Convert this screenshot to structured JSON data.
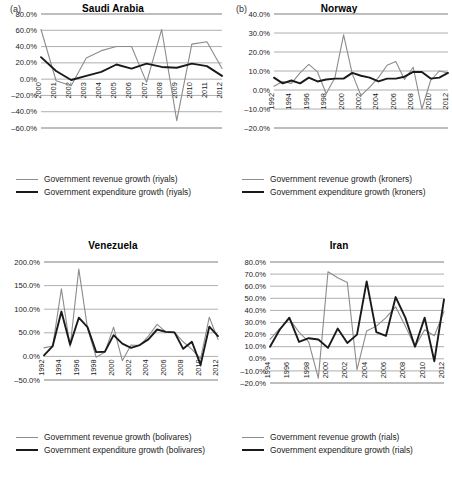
{
  "figure": {
    "panels": [
      {
        "tag": "(a)",
        "title": "Saudi Arabia",
        "legend": [
          {
            "label": "Government revenue growth (riyals)",
            "style": "rev"
          },
          {
            "label": "Government expenditure growth (riyals)",
            "style": "exp"
          }
        ],
        "chart_data": {
          "type": "line",
          "title": "Saudi Arabia",
          "xlabel": "",
          "ylabel": "",
          "grid": true,
          "legend_position": "bottom",
          "ylim": [
            -60,
            80
          ],
          "yticks": [
            -60,
            -40,
            -20,
            0,
            20,
            40,
            60,
            80
          ],
          "ytick_labels": [
            "–60.0%",
            "–40.0%",
            "–20.0%",
            "0.0%",
            "20.0%",
            "40.0%",
            "60.0%",
            "80.0%"
          ],
          "x": [
            2000,
            2001,
            2002,
            2003,
            2004,
            2005,
            2006,
            2007,
            2008,
            2009,
            2010,
            2011,
            2012
          ],
          "xtick_labels": [
            "2000",
            "2001",
            "2002",
            "2003",
            "2004",
            "2005",
            "2006",
            "2007",
            "2008",
            "2009",
            "2010",
            "2011",
            "2012"
          ],
          "series": [
            {
              "name": "Government revenue growth (riyals)",
              "color": "#8c8c8c",
              "values": [
                61.0,
                -2.0,
                -8.0,
                26.0,
                35.0,
                40.0,
                40.0,
                -4.0,
                61.0,
                -51.0,
                43.0,
                46.0,
                13.0
              ]
            },
            {
              "name": "Government expenditure growth (riyals)",
              "color": "#1a1a1a",
              "values": [
                27.0,
                10.0,
                -1.0,
                4.0,
                9.0,
                18.0,
                13.0,
                19.0,
                15.0,
                14.0,
                19.0,
                16.0,
                4.0
              ]
            }
          ]
        }
      },
      {
        "tag": "(b)",
        "title": "Norway",
        "legend": [
          {
            "label": "Government revenue growth (kroners)",
            "style": "rev"
          },
          {
            "label": "Government expenditure growth (kroners)",
            "style": "exp"
          }
        ],
        "chart_data": {
          "type": "line",
          "title": "Norway",
          "xlabel": "",
          "ylabel": "",
          "grid": true,
          "legend_position": "bottom",
          "ylim": [
            -20,
            40
          ],
          "yticks": [
            -20,
            -10,
            0,
            10,
            20,
            30,
            40
          ],
          "ytick_labels": [
            "–20.0%",
            "–10.0%",
            "0.0%",
            "10.0%",
            "20.0%",
            "30.0%",
            "40.0%"
          ],
          "x": [
            1992,
            1993,
            1994,
            1995,
            1996,
            1997,
            1998,
            1999,
            2000,
            2001,
            2002,
            2003,
            2004,
            2005,
            2006,
            2007,
            2008,
            2009,
            2010,
            2011,
            2012
          ],
          "xtick_labels": [
            "1992",
            "1994",
            "1996",
            "1998",
            "2000",
            "2002",
            "2004",
            "2006",
            "2008",
            "2010",
            "2012"
          ],
          "series": [
            {
              "name": "Government revenue growth (kroners)",
              "color": "#8c8c8c",
              "values": [
                2.0,
                4.5,
                3.5,
                9.0,
                13.5,
                9.5,
                -2.0,
                6.5,
                29.0,
                8.5,
                -3.0,
                1.5,
                6.5,
                13.0,
                15.0,
                5.5,
                12.0,
                -10.0,
                5.0,
                10.0,
                9.0
              ]
            },
            {
              "name": "Government expenditure growth (kroners)",
              "color": "#1a1a1a",
              "values": [
                6.5,
                3.5,
                5.0,
                3.5,
                6.5,
                4.5,
                5.5,
                6.0,
                6.0,
                9.0,
                7.5,
                6.5,
                4.5,
                6.0,
                6.0,
                7.0,
                9.5,
                9.5,
                6.0,
                6.5,
                9.0
              ]
            }
          ]
        }
      },
      {
        "tag": "",
        "title": "Venezuela",
        "legend": [
          {
            "label": "Government revenue growth (bolivares)",
            "style": "rev"
          },
          {
            "label": "Government expenditure growth (bolivares)",
            "style": "exp"
          }
        ],
        "chart_data": {
          "type": "line",
          "title": "Venezuela",
          "xlabel": "",
          "ylabel": "",
          "grid": true,
          "legend_position": "bottom",
          "ylim": [
            -50,
            200
          ],
          "yticks": [
            -50,
            0,
            50,
            100,
            150,
            200
          ],
          "ytick_labels": [
            "–50.0%",
            "0.0%",
            "50.0%",
            "100.0%",
            "150.0%",
            "200.0%"
          ],
          "x": [
            1992,
            1993,
            1994,
            1995,
            1996,
            1997,
            1998,
            1999,
            2000,
            2001,
            2002,
            2003,
            2004,
            2005,
            2006,
            2007,
            2008,
            2009,
            2010,
            2011,
            2012
          ],
          "xtick_labels": [
            "1992",
            "1994",
            "1996",
            "1998",
            "2000",
            "2002",
            "2004",
            "2006",
            "2008",
            "2010",
            "2012"
          ],
          "series": [
            {
              "name": "Government revenue growth (bolivares)",
              "color": "#8c8c8c",
              "values": [
                18.0,
                22.0,
                143.0,
                20.0,
                185.0,
                60.0,
                -2.0,
                9.0,
                62.0,
                -9.0,
                24.0,
                23.0,
                43.0,
                68.0,
                52.0,
                51.0,
                31.0,
                15.0,
                -5.0,
                83.0,
                36.0
              ]
            },
            {
              "name": "Government expenditure growth (bolivares)",
              "color": "#1a1a1a",
              "values": [
                2.0,
                22.0,
                95.0,
                25.0,
                82.0,
                62.0,
                9.0,
                10.0,
                45.0,
                27.0,
                18.0,
                24.0,
                36.0,
                57.0,
                52.0,
                51.0,
                16.0,
                31.0,
                -18.0,
                63.0,
                43.0
              ]
            }
          ]
        }
      },
      {
        "tag": "",
        "title": "Iran",
        "legend": [
          {
            "label": "Government revenue growth (rials)",
            "style": "rev"
          },
          {
            "label": "Government expenditure growth (rials)",
            "style": "exp"
          }
        ],
        "chart_data": {
          "type": "line",
          "title": "Iran",
          "xlabel": "",
          "ylabel": "",
          "grid": true,
          "legend_position": "bottom",
          "ylim": [
            -20,
            80
          ],
          "yticks": [
            -20,
            -10,
            0,
            10,
            20,
            30,
            40,
            50,
            60,
            70,
            80
          ],
          "ytick_labels": [
            "–20.0%",
            "–10.0%",
            "0.0%",
            "10.0%",
            "20.0%",
            "30.0%",
            "40.0%",
            "50.0%",
            "60.0%",
            "70.0%",
            "80.0%"
          ],
          "x": [
            1994,
            1995,
            1996,
            1997,
            1998,
            1999,
            2000,
            2001,
            2002,
            2003,
            2004,
            2005,
            2006,
            2007,
            2008,
            2009,
            2010,
            2011,
            2012
          ],
          "xtick_labels": [
            "1994",
            "1996",
            "1998",
            "2000",
            "2002",
            "2004",
            "2006",
            "2008",
            "2010",
            "2012"
          ],
          "series": [
            {
              "name": "Government revenue growth (rials)",
              "color": "#8c8c8c",
              "values": [
                16.0,
                25.0,
                33.0,
                22.0,
                14.0,
                -16.0,
                72.0,
                67.0,
                63.0,
                -9.0,
                23.0,
                27.0,
                34.0,
                43.0,
                27.0,
                10.0,
                24.0,
                19.0,
                39.0
              ]
            },
            {
              "name": "Government expenditure growth (rials)",
              "color": "#1a1a1a",
              "values": [
                10.0,
                24.0,
                34.0,
                14.0,
                17.0,
                16.0,
                9.0,
                25.0,
                13.0,
                20.0,
                64.0,
                22.0,
                19.0,
                51.0,
                34.0,
                10.0,
                34.0,
                -2.0,
                49.0
              ]
            }
          ]
        }
      }
    ]
  }
}
